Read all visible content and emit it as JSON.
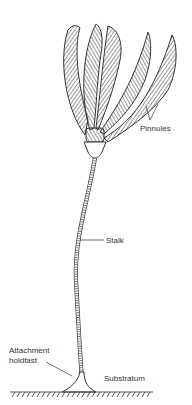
{
  "diagram": {
    "labels": {
      "pinnules": "Pinnules",
      "stalk": "Stalk",
      "attachment_line1": "Attachment",
      "attachment_line2": "holdfast",
      "substratum": "Substratum"
    },
    "colors": {
      "ink": "#333333",
      "background": "#ffffff"
    }
  }
}
